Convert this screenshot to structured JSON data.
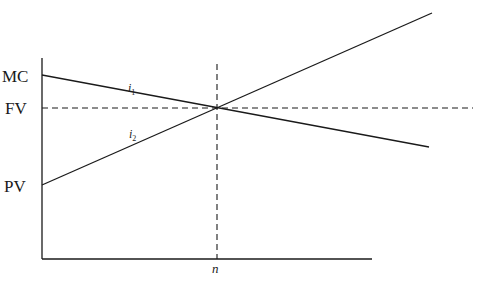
{
  "diagram": {
    "y_labels": {
      "mc": "MC",
      "fv": "FV",
      "pv": "PV"
    },
    "x_labels": {
      "n": "n"
    },
    "lines": [
      {
        "id": "i1",
        "label": "i",
        "subscript": "1",
        "style": "solid",
        "description": "declining line from MC through intersection"
      },
      {
        "id": "i2",
        "label": "i",
        "subscript": "2",
        "style": "solid",
        "description": "rising line from PV through intersection"
      },
      {
        "id": "fv-ref",
        "style": "dashed",
        "description": "horizontal reference at FV"
      },
      {
        "id": "n-ref",
        "style": "dashed",
        "description": "vertical reference at n"
      }
    ],
    "colors": {
      "ink": "#1a1a1a",
      "background": "#ffffff"
    }
  }
}
